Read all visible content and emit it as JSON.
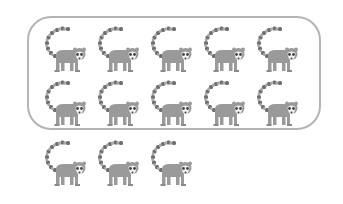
{
  "figure": {
    "grouped_count": 10,
    "ungrouped_count": 3,
    "total_count": 13,
    "icon": "lemur-icon",
    "colors": {
      "body": "#9a9a9a",
      "tail_ring": "#6e6e6e",
      "face": "#f2f2f2",
      "box_border": "#b4b4b4"
    },
    "rows": [
      {
        "label": "row-1",
        "count": 5,
        "in_group": true
      },
      {
        "label": "row-2",
        "count": 5,
        "in_group": true
      },
      {
        "label": "row-3",
        "count": 3,
        "in_group": false
      }
    ]
  }
}
